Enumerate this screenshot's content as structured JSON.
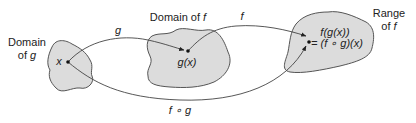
{
  "diagram": {
    "type": "function-composition",
    "colors": {
      "background": "#ffffff",
      "blob_fill": "#dcdcdc",
      "blob_stroke": "#555555",
      "curve": "#444444",
      "text": "#222222"
    },
    "sets": [
      {
        "id": "domain_g",
        "label_line1": "Domain",
        "label_line2_prefix": "of ",
        "label_line2_var": "g"
      },
      {
        "id": "domain_f",
        "label_prefix": "Domain of ",
        "label_var": "f"
      },
      {
        "id": "range_f",
        "label_line1": "Range",
        "label_line2_prefix": "of ",
        "label_line2_var": "f"
      }
    ],
    "points": {
      "x": "x",
      "gx": "g(x)",
      "fgx_line1": "f(g(x))",
      "fgx_line2": "= (f ∘ g)(x)"
    },
    "arrows": {
      "g": "g",
      "f": "f",
      "composition": "f ∘ g"
    }
  }
}
